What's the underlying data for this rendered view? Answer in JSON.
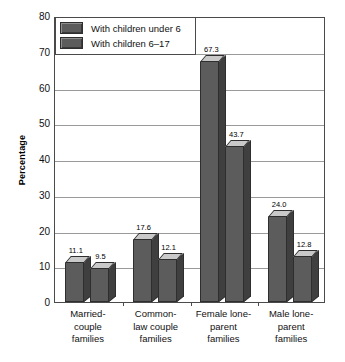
{
  "chart_data": {
    "type": "bar",
    "title": "",
    "xlabel": "",
    "ylabel": "Percentage",
    "ylim": [
      0,
      80
    ],
    "yticks": [
      0,
      10,
      20,
      30,
      40,
      50,
      60,
      70,
      80
    ],
    "grid": true,
    "legend_position": "top-left",
    "categories": [
      "Married-\ncouple\nfamilies",
      "Common-\nlaw couple\nfamilies",
      "Female lone-\nparent\nfamilies",
      "Male lone-\nparent\nfamilies"
    ],
    "category_lines": [
      [
        "Married-",
        "couple",
        "families"
      ],
      [
        "Common-",
        "law couple",
        "families"
      ],
      [
        "Female lone-",
        "parent",
        "families"
      ],
      [
        "Male lone-",
        "parent",
        "families"
      ]
    ],
    "series": [
      {
        "name": "With children under 6",
        "values": [
          11.1,
          17.6,
          67.3,
          24.0
        ],
        "labels": [
          "11.1",
          "17.6",
          "67.3",
          "24.0"
        ],
        "color": "#5c5c5c"
      },
      {
        "name": "With children 6-17",
        "values": [
          9.5,
          12.1,
          43.7,
          12.8
        ],
        "labels": [
          "9.5",
          "12.1",
          "43.7",
          "12.8"
        ],
        "color": "#5c5c5c"
      }
    ]
  },
  "legend": {
    "items": [
      {
        "label": "With children under 6",
        "swatch": "#5c5c5c"
      },
      {
        "label": "With children 6–17",
        "swatch": "#5c5c5c"
      }
    ]
  },
  "axis": {
    "y_title": "Percentage",
    "y_tick_labels": [
      "80",
      "70",
      "60",
      "50",
      "40",
      "30",
      "20",
      "10",
      "0"
    ]
  },
  "colors": {
    "bar_front": "#5c5c5c",
    "bar_side": "#3f3f3f",
    "bar_top": "#c9c9c9",
    "bar_outline": "#2e2e2e",
    "gridline": "#9a9a9a",
    "frame": "#4a4a4a",
    "background": "#ffffff",
    "text": "#111111"
  }
}
